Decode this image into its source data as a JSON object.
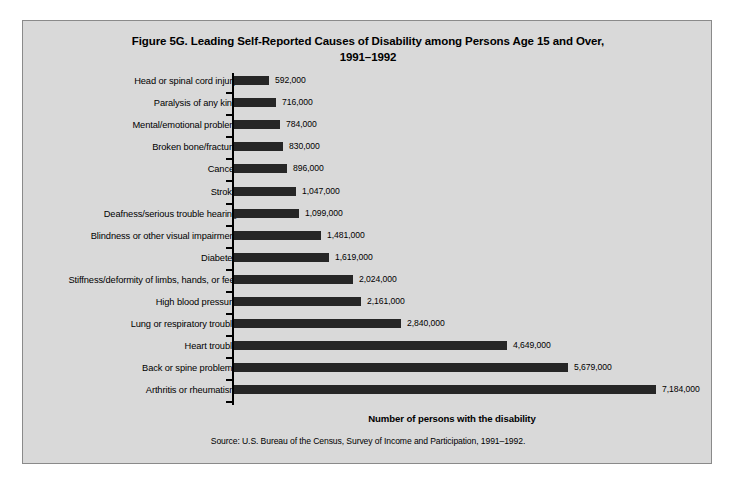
{
  "figure": {
    "title_line1": "Figure 5G. Leading Self-Reported Causes of Disability among Persons Age 15 and Over,",
    "title_line2": "1991–1992",
    "xlabel": "Number of persons with the disability",
    "source": "Source: U.S. Bureau of the Census, Survey of Income and Participation, 1991–1992.",
    "bar_color": "#262626",
    "background_color": "#d9d9d9",
    "border_color": "#8a8a8a"
  },
  "chart_data": {
    "type": "bar",
    "orientation": "horizontal",
    "title": "Figure 5G. Leading Self-Reported Causes of Disability among Persons Age 15 and Over, 1991–1992",
    "xlabel": "Number of persons with the disability",
    "ylabel": "",
    "xlim": [
      0,
      7184000
    ],
    "grid": false,
    "legend": "none",
    "source": "Source: U.S. Bureau of the Census, Survey of Income and Participation, 1991–1992.",
    "categories": [
      "Head or spinal cord injury",
      "Paralysis of any kind",
      "Mental/emotional problem",
      "Broken bone/fracture",
      "Cancer",
      "Stroke",
      "Deafness/serious trouble hearing",
      "Blindness or other visual impairment",
      "Diabetes",
      "Stiffness/deformity of limbs, hands, or feet",
      "High blood pressure",
      "Lung or respiratory trouble",
      "Heart trouble",
      "Back or spine problems",
      "Arthritis or rheumatism"
    ],
    "values": [
      592000,
      716000,
      784000,
      830000,
      896000,
      1047000,
      1099000,
      1481000,
      1619000,
      2024000,
      2161000,
      2840000,
      4649000,
      5679000,
      7184000
    ],
    "value_labels": [
      "592,000",
      "716,000",
      "784,000",
      "830,000",
      "896,000",
      "1,047,000",
      "1,099,000",
      "1,481,000",
      "1,619,000",
      "2,024,000",
      "2,161,000",
      "2,840,000",
      "4,649,000",
      "5,679,000",
      "7,184,000"
    ]
  }
}
